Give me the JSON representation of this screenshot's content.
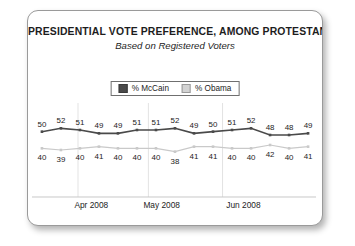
{
  "chart_data": {
    "type": "line",
    "title": "PRESIDENTIAL VOTE PREFERENCE, AMONG PROTESTANTS",
    "subtitle": "Based on Registered Voters",
    "xlabel": "",
    "ylabel": "",
    "ylim": [
      36,
      54
    ],
    "grid": true,
    "legend_position": "top-center",
    "x": [
      1,
      2,
      3,
      4,
      5,
      6,
      7,
      8,
      9,
      10,
      11,
      12,
      13,
      14,
      15
    ],
    "tick_labels": [
      "Apr 2008",
      "May 2008",
      "Jun 2008"
    ],
    "tick_positions": [
      2.6,
      6.3,
      10.6
    ],
    "gridline_positions": [
      1.9,
      5.6,
      9.5
    ],
    "series": [
      {
        "name": "% McCain",
        "color": "#4a4a4a",
        "values": [
          50,
          52,
          51,
          49,
          49,
          51,
          51,
          52,
          49,
          50,
          51,
          52,
          48,
          48,
          49
        ]
      },
      {
        "name": "% Obama",
        "color": "#c9c9c9",
        "values": [
          40,
          39,
          40,
          41,
          40,
          40,
          40,
          38,
          41,
          41,
          40,
          40,
          42,
          40,
          41
        ]
      }
    ]
  },
  "card": {
    "title": "PRESIDENTIAL VOTE PREFERENCE, AMONG PROTESTANTS",
    "subtitle": "Based on Registered Voters"
  },
  "legend": {
    "mccain_label": "% McCain",
    "obama_label": "% Obama"
  },
  "axis": {
    "labels": [
      "Apr 2008",
      "May 2008",
      "Jun 2008"
    ]
  }
}
